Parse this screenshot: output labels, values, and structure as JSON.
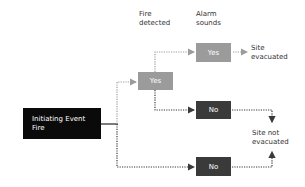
{
  "headers": {
    "fire_detected": "Fire\ndetected",
    "alarm_sounds": "Alarm\nsounds"
  },
  "initiating_event": {
    "line1": "Initiating Event",
    "line2": "Fire"
  },
  "nodes": {
    "fire_yes": "Yes",
    "fire_no": "No",
    "alarm_yes": "Yes",
    "alarm_no": "No"
  },
  "outcomes": {
    "evacuated_line1": "Site",
    "evacuated_line2": "evacuated",
    "not_evacuated_line1": "Site not",
    "not_evacuated_line2": "evacuated"
  },
  "colors": {
    "yes_box": "#9b9b9b",
    "no_box": "#3a3a3a",
    "init_box": "#0a0a0a",
    "yes_path": "#9b9b9b",
    "no_path": "#3a3a3a"
  }
}
